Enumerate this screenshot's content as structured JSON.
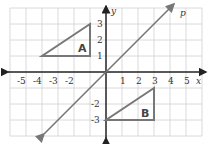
{
  "diagram": {
    "type": "coordinate-plane",
    "x_axis_label": "x",
    "y_axis_label": "y",
    "line_label": "p",
    "x_ticks": [
      "-5",
      "-4",
      "-3",
      "-2",
      "1",
      "2",
      "3",
      "4",
      "5"
    ],
    "y_ticks": [
      "3",
      "2",
      "1",
      "-2",
      "-3"
    ],
    "triangle_a": {
      "label": "A",
      "vertices": [
        [
          -4,
          1
        ],
        [
          -1,
          1
        ],
        [
          -1,
          3
        ]
      ]
    },
    "triangle_b": {
      "label": "B",
      "vertices": [
        [
          0,
          -3
        ],
        [
          3,
          -3
        ],
        [
          3,
          -1
        ]
      ]
    },
    "line_p": {
      "equation": "y = x"
    },
    "colors": {
      "shapes": "#777777",
      "axes": "#222222",
      "grid": "#cccccc"
    }
  }
}
